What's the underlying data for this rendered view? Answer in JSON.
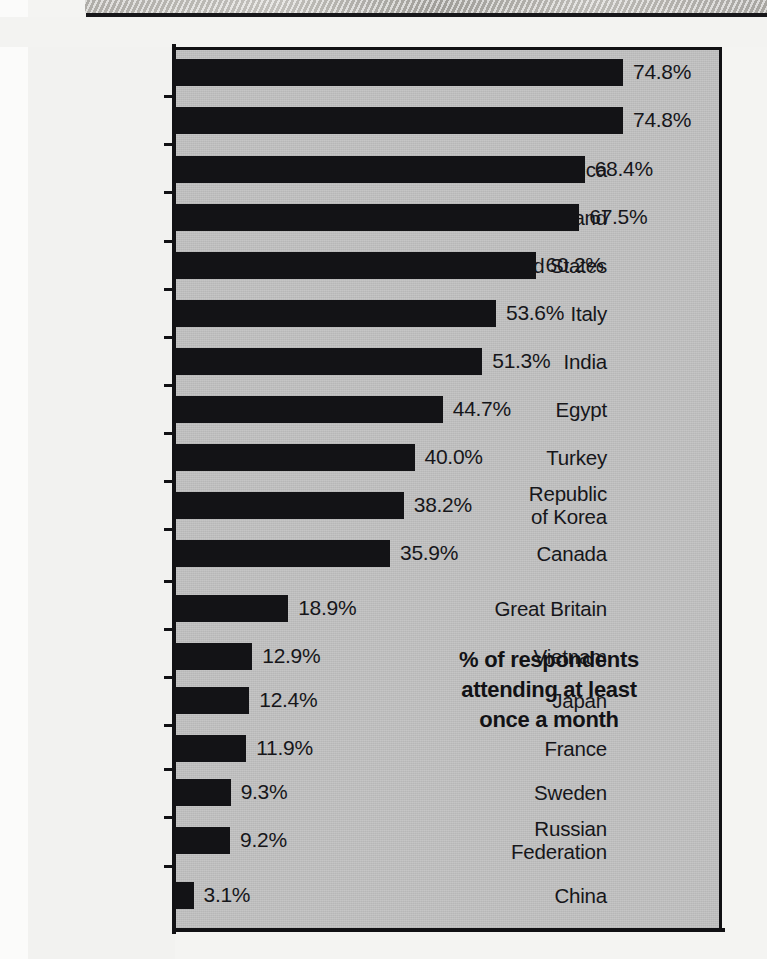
{
  "chart_data": {
    "type": "bar",
    "orientation": "horizontal",
    "title": "",
    "xlabel": "",
    "ylabel": "",
    "annotation": "% of respondents\nattending at least\nonce a month",
    "value_suffix": "%",
    "xlim": [
      0,
      80
    ],
    "grid": false,
    "legend": "none",
    "categories": [
      "Brazil",
      "Mexico",
      "South Africa",
      "Ireland",
      "United States",
      "Italy",
      "India",
      "Egypt",
      "Turkey",
      "Republic\nof Korea",
      "Canada",
      "Great Britain",
      "Vietnam",
      "Japan",
      "France",
      "Sweden",
      "Russian\nFederation",
      "China"
    ],
    "values": [
      74.8,
      74.8,
      68.4,
      67.5,
      60.2,
      53.6,
      51.3,
      44.7,
      40.0,
      38.2,
      35.9,
      18.9,
      12.9,
      12.4,
      11.9,
      9.3,
      9.2,
      3.1
    ],
    "value_labels": [
      "74.8%",
      "74.8%",
      "68.4%",
      "67.5%",
      "60.2%",
      "53.6%",
      "51.3%",
      "44.7%",
      "40.0%",
      "38.2%",
      "35.9%",
      "18.9%",
      "12.9%",
      "12.4%",
      "11.9%",
      "9.3%",
      "9.2%",
      "3.1%"
    ],
    "colors": {
      "bar": "#131316",
      "plot_background": "#c3c3c3",
      "page_background": "#f2f2f0",
      "axis": "#111114",
      "text": "#16161a"
    }
  }
}
